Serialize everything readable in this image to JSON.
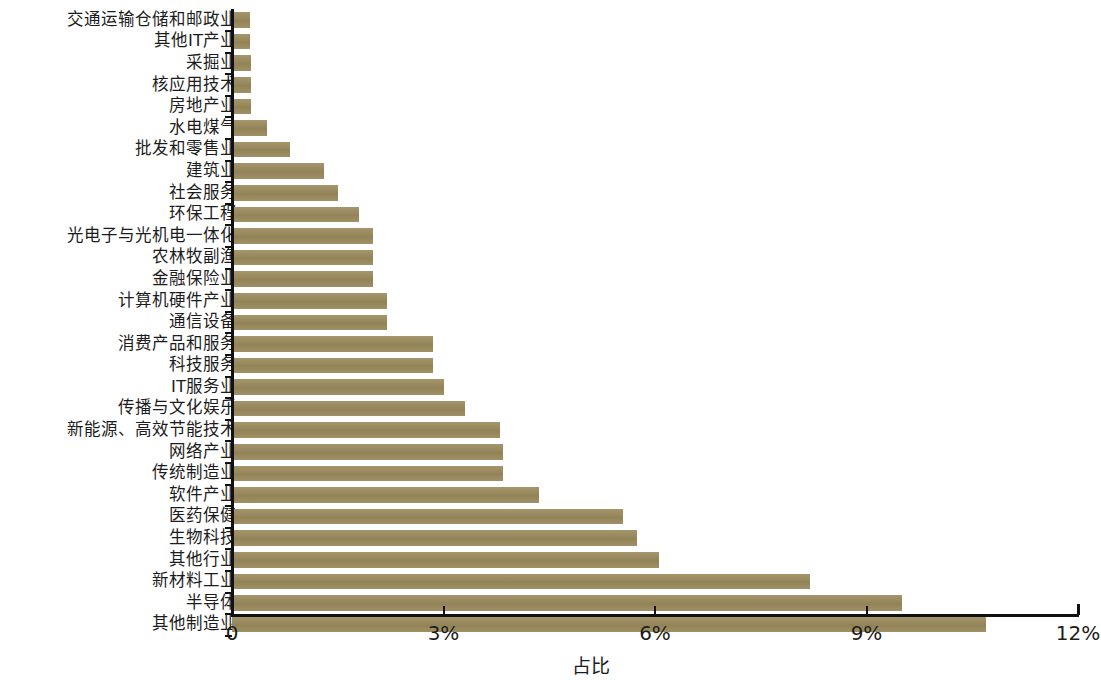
{
  "chart_data": {
    "type": "bar",
    "orientation": "horizontal",
    "title": "",
    "subtitle": "",
    "xlabel": "占比",
    "ylabel": "",
    "xlim": [
      0,
      12
    ],
    "x_tick_values": [
      0,
      3,
      6,
      9,
      12
    ],
    "x_tick_labels": [
      "0",
      "3%",
      "6%",
      "9%",
      "12%"
    ],
    "grid": false,
    "legend": null,
    "bar_color": "#9a8a5c",
    "axis_color": "#111111",
    "background_color": "#ffffff",
    "unit": "%",
    "categories": [
      "交通运输仓储和邮政业",
      "其他IT产业",
      "采掘业",
      "核应用技术",
      "房地产业",
      "水电煤气",
      "批发和零售业",
      "建筑业",
      "社会服务",
      "环保工程",
      "光电子与光机电一体化",
      "农林牧副渔",
      "金融保险业",
      "计算机硬件产业",
      "通信设备",
      "消费产品和服务",
      "科技服务",
      "IT服务业",
      "传播与文化娱乐",
      "新能源、高效节能技术",
      "网络产业",
      "传统制造业",
      "软件产业",
      "医药保健",
      "生物科技",
      "其他行业",
      "新材料工业",
      "半导体",
      "其他制造业"
    ],
    "values": [
      0.25,
      0.25,
      0.27,
      0.27,
      0.27,
      0.5,
      0.82,
      1.3,
      1.5,
      1.8,
      2.0,
      2.0,
      2.0,
      2.2,
      2.2,
      2.85,
      2.85,
      3.0,
      3.3,
      3.8,
      3.85,
      3.85,
      4.35,
      5.55,
      5.75,
      6.05,
      8.2,
      9.5,
      10.7
    ]
  }
}
